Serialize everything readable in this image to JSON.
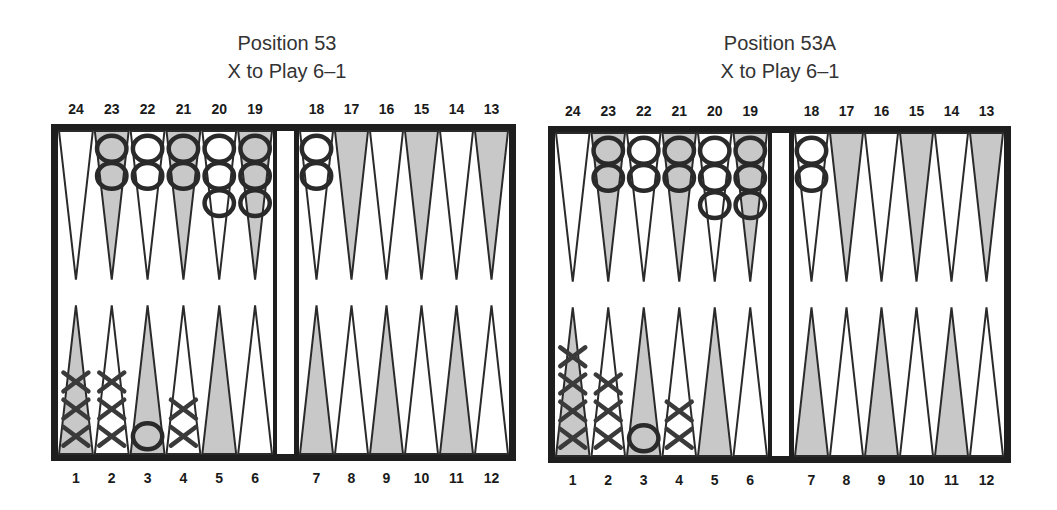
{
  "boards": [
    {
      "id": "position-53",
      "title": "Position 53",
      "subtitle": "X to Play 6–1",
      "frame": {
        "x": 51,
        "y": 124,
        "w": 465,
        "h": 337,
        "bar_left": 273,
        "bar_right": 298
      },
      "title_center_x": 287,
      "top_labels": [
        "24",
        "23",
        "22",
        "21",
        "20",
        "19",
        "18",
        "17",
        "16",
        "15",
        "14",
        "13"
      ],
      "bottom_labels": [
        "1",
        "2",
        "3",
        "4",
        "5",
        "6",
        "7",
        "8",
        "9",
        "10",
        "11",
        "12"
      ],
      "points": {
        "1": {
          "X": 3
        },
        "2": {
          "X": 3
        },
        "3": {
          "O": 1
        },
        "4": {
          "X": 2
        },
        "18": {
          "O": 2
        },
        "19": {
          "O": 3
        },
        "20": {
          "O": 3
        },
        "21": {
          "O": 2
        },
        "22": {
          "O": 2
        },
        "23": {
          "O": 2
        }
      }
    },
    {
      "id": "position-53a",
      "title": "Position 53A",
      "subtitle": "X to Play 6–1",
      "frame": {
        "x": 548,
        "y": 126,
        "w": 463,
        "h": 337,
        "bar_left": 768,
        "bar_right": 793
      },
      "title_center_x": 780,
      "top_labels": [
        "24",
        "23",
        "22",
        "21",
        "20",
        "19",
        "18",
        "17",
        "16",
        "15",
        "14",
        "13"
      ],
      "bottom_labels": [
        "1",
        "2",
        "3",
        "4",
        "5",
        "6",
        "7",
        "8",
        "9",
        "10",
        "11",
        "12"
      ],
      "points": {
        "1": {
          "X": 4
        },
        "2": {
          "X": 3
        },
        "3": {
          "O": 1
        },
        "4": {
          "X": 2
        },
        "18": {
          "O": 2
        },
        "19": {
          "O": 3
        },
        "20": {
          "O": 3
        },
        "21": {
          "O": 2
        },
        "22": {
          "O": 2
        },
        "23": {
          "O": 2
        }
      }
    }
  ],
  "colors": {
    "frame": "#1e1e1e",
    "shade": "#c8c8c8",
    "ink": "#2a2a2a",
    "label": "#1a1a1a"
  }
}
